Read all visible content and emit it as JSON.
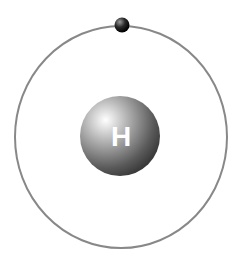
{
  "diagram": {
    "nucleus": {
      "symbol": "H",
      "color": "#8a8a8a"
    },
    "orbit": {
      "color": "#888888"
    },
    "electron": {
      "color": "#1a1a1a",
      "count": 1
    }
  }
}
